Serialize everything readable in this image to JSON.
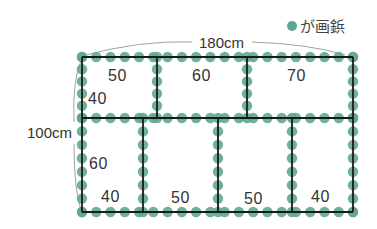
{
  "legend": {
    "icon": "green-dot",
    "label": "が画鋲",
    "color": "#5fa890"
  },
  "dimensions": {
    "width_label": "180cm",
    "height_label": "100cm"
  },
  "frame": {
    "line_color": "#1a1a1a",
    "dot_color": "#5fa890"
  },
  "top_row": {
    "height_label": "40",
    "cells": [
      {
        "width_label": "50"
      },
      {
        "width_label": "60"
      },
      {
        "width_label": "70"
      }
    ]
  },
  "bottom_row": {
    "height_label": "60",
    "cells": [
      {
        "width_label": "40"
      },
      {
        "width_label": "50"
      },
      {
        "width_label": "50"
      },
      {
        "width_label": "40"
      }
    ]
  }
}
